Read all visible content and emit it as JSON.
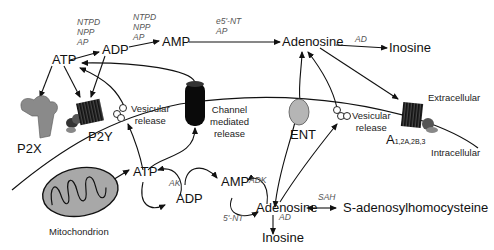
{
  "diagram": {
    "title": "",
    "regions": {
      "extracellular": "Extracellular",
      "intracellular": "Intracellular"
    },
    "nodes": {
      "atp_ext": "ATP",
      "adp_ext": "ADP",
      "amp_ext": "AMP",
      "adenosine_ext": "Adenosine",
      "inosine_ext": "Inosine",
      "atp_int": "ATP",
      "adp_int": "ADP",
      "amp_int": "AMP",
      "adenosine_int": "Adenosine",
      "inosine_int": "Inosine",
      "sah_product": "S-adenosylhomocysteine"
    },
    "enzymes": {
      "atp_to_adp": [
        "NTPD",
        "NPP",
        "AP"
      ],
      "adp_to_amp": [
        "NTPD",
        "NPP",
        "AP"
      ],
      "amp_to_adenosine": [
        "e5'-NT",
        "AP"
      ],
      "adenosine_to_inosine_ext": "AD",
      "atp_adp_int": "AK",
      "amp_adenosine_adk": "ADK",
      "amp_adenosine_5nt": "5'-NT",
      "adenosine_to_inosine_int": "AD",
      "adenosine_sah": "SAH"
    },
    "receptors": {
      "p2x": "P2X",
      "p2y": "P2Y",
      "a_receptor": "A",
      "a_receptor_subscript": "1,2A,2B,3",
      "ent": "ENT"
    },
    "release": {
      "vesicular_left_1": "Vesicular",
      "vesicular_left_2": "release",
      "channel_1": "Channel",
      "channel_2": "mediated",
      "channel_3": "release",
      "vesicular_right_1": "Vesicular",
      "vesicular_right_2": "release"
    },
    "organelle": {
      "mitochondrion": "Mitochondrion"
    },
    "colors": {
      "line": "#111111",
      "receptor_gray": "#8a8a8a",
      "ent_gray": "#b5b5b5",
      "channel_black": "#0a0a0a",
      "mito_fill": "#a8a8a8",
      "enzyme_text": "#555555"
    }
  }
}
